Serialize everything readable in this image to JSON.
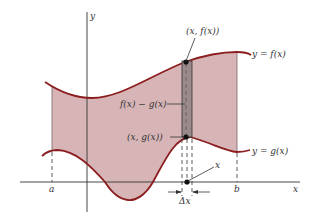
{
  "diagram": {
    "colors": {
      "region_fill": "#d7b5b7",
      "curve": "#8b1d1f",
      "strip_fill": "#9a8a8a",
      "axis": "#333333",
      "background": "#ffffff"
    },
    "axes": {
      "x_label": "x",
      "y_label": "y"
    },
    "bounds": {
      "a_label": "a",
      "b_label": "b"
    },
    "curves": {
      "f_label": "y = f(x)",
      "g_label": "y = g(x)"
    },
    "strip": {
      "top_point_label": "(x, f(x))",
      "bottom_point_label": "(x, g(x))",
      "height_label": "f(x) − g(x)",
      "width_label": "Δx",
      "x_point_label": "x"
    }
  }
}
